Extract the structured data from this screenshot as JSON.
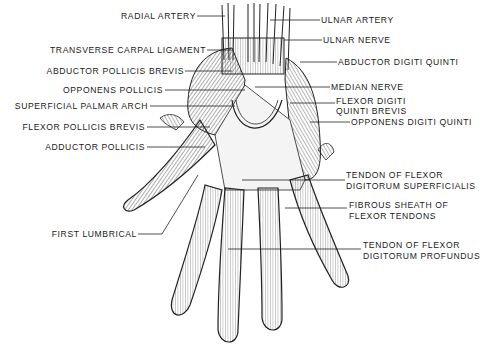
{
  "figure": {
    "background": "#ffffff",
    "ink": "#1a1a1a"
  },
  "labels_left": [
    {
      "id": "radial-artery",
      "text": "RADIAL ARTERY"
    },
    {
      "id": "transverse-carpal-ligament",
      "text": "TRANSVERSE CARPAL LIGAMENT"
    },
    {
      "id": "abductor-pollicis-brevis",
      "text": "ABDUCTOR POLLICIS BREVIS"
    },
    {
      "id": "opponens-pollicis",
      "text": "OPPONENS POLLICIS"
    },
    {
      "id": "superficial-palmar-arch",
      "text": "SUPERFICIAL PALMAR ARCH"
    },
    {
      "id": "flexor-pollicis-brevis",
      "text": "FLEXOR POLLICIS BREVIS"
    },
    {
      "id": "adductor-pollicis",
      "text": "ADDUCTOR POLLICIS"
    },
    {
      "id": "first-lumbrical",
      "text": "FIRST LUMBRICAL"
    }
  ],
  "labels_right": [
    {
      "id": "ulnar-artery",
      "text": "ULNAR ARTERY"
    },
    {
      "id": "ulnar-nerve",
      "text": "ULNAR NERVE"
    },
    {
      "id": "abductor-digiti-quinti",
      "text": "ABDUCTOR DIGITI QUINTI"
    },
    {
      "id": "median-nerve",
      "text": "MEDIAN NERVE"
    },
    {
      "id": "flexor-digiti-quinti-brevis",
      "line1": "FLEXOR DIGITI",
      "line2": "QUINTI BREVIS"
    },
    {
      "id": "opponens-digiti-quinti",
      "text": "OPPONENS DIGITI QUINTI"
    },
    {
      "id": "tendon-flexor-superficialis",
      "line1": "TENDON OF FLEXOR",
      "line2": "DIGITORUM SUPERFICIALIS"
    },
    {
      "id": "fibrous-sheath",
      "line1": "FIBROUS SHEATH OF",
      "line2": "FLEXOR TENDONS"
    },
    {
      "id": "tendon-flexor-profundus",
      "line1": "TENDON OF FLEXOR",
      "line2": "DIGITORUM PROFUNDUS"
    }
  ]
}
